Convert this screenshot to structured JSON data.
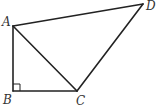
{
  "diagram": {
    "type": "geometry",
    "points": {
      "A": {
        "label": "A",
        "x": 13,
        "y": 26
      },
      "B": {
        "label": "B",
        "x": 13,
        "y": 91
      },
      "C": {
        "label": "C",
        "x": 77,
        "y": 91
      },
      "D": {
        "label": "D",
        "x": 143,
        "y": 4
      }
    },
    "segments": [
      "AB",
      "BC",
      "AC",
      "AD",
      "CD"
    ],
    "right_angle_at": "B",
    "colors": {
      "stroke": "#222222",
      "label": "#333333",
      "background": "#ffffff"
    }
  }
}
